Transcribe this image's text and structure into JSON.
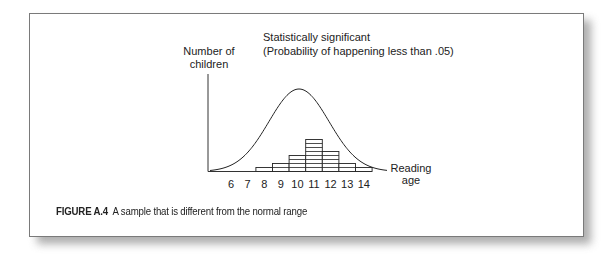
{
  "figure": {
    "caption_label": "FIGURE A.4",
    "caption_text": "A sample that is different from the normal range"
  },
  "chart_data": {
    "type": "bar",
    "title": "Statistically significant",
    "subtitle": "(Probability of happening less than .05)",
    "ylabel_line1": "Number of",
    "ylabel_line2": "children",
    "xlabel_line1": "Reading",
    "xlabel_line2": "age",
    "x_ticks": [
      "6",
      "7",
      "8",
      "9",
      "10",
      "11",
      "12",
      "13",
      "14"
    ],
    "categories": [
      "8",
      "9",
      "10",
      "11",
      "12",
      "13",
      "14"
    ],
    "values": [
      1,
      2,
      4,
      8,
      5,
      2,
      1
    ],
    "overlay": {
      "type": "normal-curve",
      "peak_at": 10
    },
    "grid": false,
    "legend": "none"
  }
}
